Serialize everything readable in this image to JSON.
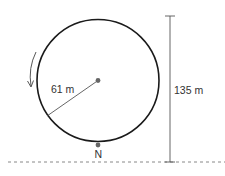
{
  "diagram": {
    "radius_label": "61 m",
    "height_label": "135 m",
    "point_label": "N",
    "rotation_direction": "counterclockwise",
    "colors": {
      "circle": "#1a1a1a",
      "lines": "#555555",
      "dots": "#666666",
      "ground": "#888888"
    }
  }
}
